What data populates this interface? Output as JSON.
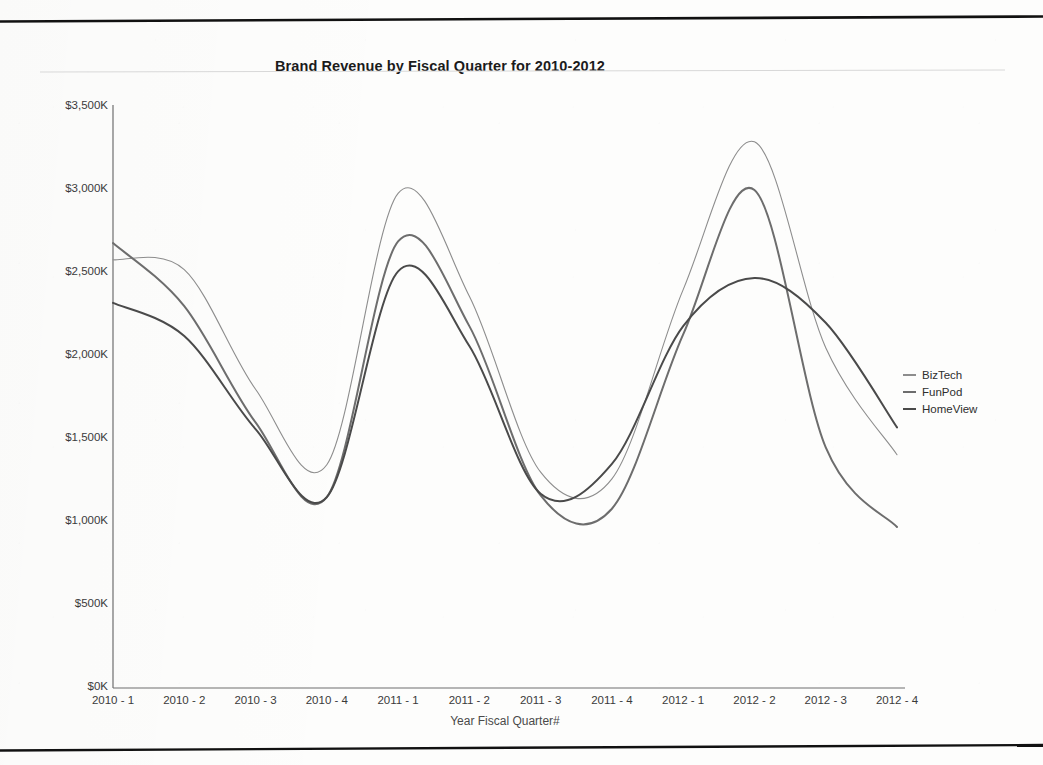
{
  "document": {
    "rule_color": "#111111"
  },
  "chart": {
    "title": "Brand Revenue by Fiscal Quarter for 2010-2012",
    "x_axis_title": "Year Fiscal Quarter#",
    "axis_color": "#6f6f6f",
    "plot": {
      "left": 113,
      "right": 897,
      "top": 107,
      "bottom": 688
    }
  },
  "legend": {
    "position": "right",
    "items": [
      {
        "label": "BizTech",
        "color": "#8d8d8d"
      },
      {
        "label": "FunPod",
        "color": "#6d6d6d"
      },
      {
        "label": "HomeView",
        "color": "#4a4a4a"
      }
    ]
  },
  "chart_data": {
    "type": "line",
    "title": "Brand Revenue by Fiscal Quarter for 2010-2012",
    "xlabel": "Year Fiscal Quarter#",
    "ylabel": "",
    "grid": false,
    "legend_position": "right",
    "ylim": [
      0,
      3500
    ],
    "y_ticks": [
      0,
      500,
      1000,
      1500,
      2000,
      2500,
      3000,
      3500
    ],
    "y_tick_labels": [
      "$0K",
      "$500K",
      "$1,000K",
      "$1,500K",
      "$2,000K",
      "$2,500K",
      "$3,000K",
      "$3,500K"
    ],
    "categories": [
      "2010 - 1",
      "2010 - 2",
      "2010 - 3",
      "2010 - 4",
      "2011 - 1",
      "2011 - 2",
      "2011 - 3",
      "2011 - 4",
      "2012 - 1",
      "2012 - 2",
      "2012 - 3",
      "2012 - 4"
    ],
    "series": [
      {
        "name": "BizTech",
        "color": "#8d8d8d",
        "width": 1.1,
        "values": [
          2580,
          2520,
          1800,
          1345,
          2980,
          2360,
          1300,
          1260,
          2400,
          3290,
          2050,
          1405
        ]
      },
      {
        "name": "FunPod",
        "color": "#6d6d6d",
        "width": 2.0,
        "values": [
          2680,
          2300,
          1600,
          1150,
          2690,
          2180,
          1160,
          1080,
          2130,
          3000,
          1450,
          970
        ]
      },
      {
        "name": "HomeView",
        "color": "#4a4a4a",
        "width": 2.0,
        "values": [
          2320,
          2120,
          1560,
          1150,
          2510,
          2060,
          1170,
          1350,
          2180,
          2470,
          2200,
          1570
        ]
      }
    ]
  }
}
